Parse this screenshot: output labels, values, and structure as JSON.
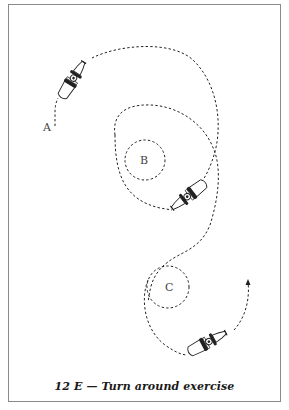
{
  "figure": {
    "caption": "12 E — Turn around exercise",
    "labels": {
      "start": "A",
      "circle_1": "B",
      "circle_2": "C"
    },
    "icons": [
      "motorcycle-icon",
      "motorcycle-icon",
      "motorcycle-icon"
    ],
    "colors": {
      "line": "#222222",
      "frame": "#8a8a8a",
      "background": "#ffffff"
    }
  }
}
